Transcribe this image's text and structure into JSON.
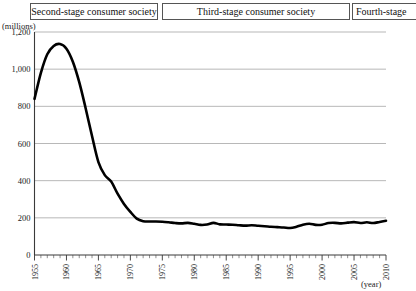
{
  "banner": {
    "stages": [
      {
        "id": "second-stage",
        "label": "Second-stage consumer society"
      },
      {
        "id": "third-stage",
        "label": "Third-stage consumer society"
      },
      {
        "id": "fourth-stage",
        "label": "Fourth-stage"
      }
    ]
  },
  "chart_data": {
    "type": "line",
    "title": "",
    "subtitle": "",
    "xlabel": "(year)",
    "ylabel": "(millions)",
    "xlim": [
      1955,
      2010
    ],
    "ylim": [
      0,
      1200
    ],
    "grid": true,
    "legend": "none",
    "y_ticks": [
      0,
      200,
      400,
      600,
      800,
      1000,
      1200
    ],
    "y_tick_labels": [
      "0",
      "200",
      "400",
      "600",
      "800",
      "1,000",
      "1,200"
    ],
    "x_ticks": [
      1955,
      1960,
      1965,
      1970,
      1975,
      1980,
      1985,
      1990,
      1995,
      2000,
      2005,
      2010
    ],
    "x_tick_labels": [
      "1955",
      "1960",
      "1965",
      "1970",
      "1975",
      "1980",
      "1985",
      "1990",
      "1995",
      "2000",
      "2005",
      "2010"
    ],
    "x_minor_tick_step": 1,
    "series": [
      {
        "name": "value",
        "color": "#000000",
        "x": [
          1955,
          1956,
          1957,
          1958,
          1959,
          1960,
          1961,
          1962,
          1963,
          1964,
          1965,
          1966,
          1967,
          1968,
          1969,
          1970,
          1971,
          1972,
          1973,
          1974,
          1975,
          1976,
          1977,
          1978,
          1979,
          1980,
          1981,
          1982,
          1983,
          1984,
          1985,
          1986,
          1987,
          1988,
          1989,
          1990,
          1991,
          1992,
          1993,
          1994,
          1995,
          1996,
          1997,
          1998,
          1999,
          2000,
          2001,
          2002,
          2003,
          2004,
          2005,
          2006,
          2007,
          2008,
          2009,
          2010
        ],
        "values": [
          840,
          980,
          1080,
          1125,
          1135,
          1110,
          1040,
          930,
          790,
          640,
          500,
          430,
          395,
          330,
          275,
          232,
          196,
          182,
          180,
          180,
          179,
          176,
          172,
          170,
          173,
          168,
          162,
          164,
          173,
          165,
          164,
          163,
          160,
          158,
          160,
          157,
          155,
          152,
          150,
          148,
          145,
          152,
          163,
          168,
          162,
          163,
          172,
          173,
          170,
          174,
          177,
          172,
          176,
          172,
          178,
          184
        ]
      }
    ]
  }
}
